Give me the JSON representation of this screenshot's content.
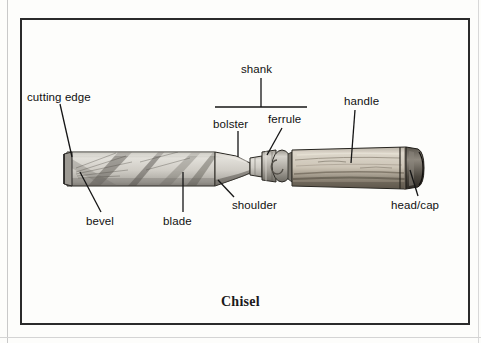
{
  "figure": {
    "caption": "Chisel",
    "frame_color": "#2b2b2b",
    "background_color": "#fdfdfb"
  },
  "labels": [
    {
      "id": "cutting-edge",
      "text": "cutting edge",
      "x": 27,
      "y": 92
    },
    {
      "id": "shank",
      "text": "shank",
      "x": 241,
      "y": 64
    },
    {
      "id": "handle",
      "text": "handle",
      "x": 344,
      "y": 96
    },
    {
      "id": "bolster",
      "text": "bolster",
      "x": 213,
      "y": 119
    },
    {
      "id": "ferrule",
      "text": "ferrule",
      "x": 268,
      "y": 114
    },
    {
      "id": "bevel",
      "text": "bevel",
      "x": 86,
      "y": 216
    },
    {
      "id": "blade",
      "text": "blade",
      "x": 163,
      "y": 216
    },
    {
      "id": "shoulder",
      "text": "shoulder",
      "x": 232,
      "y": 200
    },
    {
      "id": "head-cap",
      "text": "head/cap",
      "x": 391,
      "y": 200
    }
  ],
  "leaders": [
    {
      "id": "leader-cutting-edge",
      "points": "60,104 72,157"
    },
    {
      "id": "leader-shank-stem",
      "points": "261,78 261,107"
    },
    {
      "id": "leader-shank-bar",
      "points": "215,107 307,107"
    },
    {
      "id": "leader-bolster",
      "points": "238,131 238,157"
    },
    {
      "id": "leader-ferrule",
      "points": "282,128 267,155"
    },
    {
      "id": "leader-handle",
      "points": "355,110 351,163"
    },
    {
      "id": "leader-bevel",
      "points": "101,212 80,172"
    },
    {
      "id": "leader-blade",
      "points": "183,212 183,172"
    },
    {
      "id": "leader-shoulder",
      "points": "234,197 218,180"
    },
    {
      "id": "leader-head-cap",
      "points": "418,196 410,170"
    }
  ],
  "artwork": {
    "name": "chisel-illustration",
    "parts": [
      {
        "id": "blade",
        "description": "flat rectangular steel blade with diagonal grind streaks"
      },
      {
        "id": "bevel",
        "description": "ground bevel at the cutting tip"
      },
      {
        "id": "shoulder",
        "description": "tapered transition from blade to shank"
      },
      {
        "id": "bolster",
        "description": "narrow neck section of the shank"
      },
      {
        "id": "ferrule",
        "description": "metal collar ring between shank and handle"
      },
      {
        "id": "handle",
        "description": "turned wooden handle"
      },
      {
        "id": "head-cap",
        "description": "dark metal cap at the handle butt"
      }
    ],
    "colors": {
      "steel_light": "#d9d7d1",
      "steel_mid": "#b6b3ac",
      "steel_dark": "#4a4845",
      "wood_light": "#cfc8bc",
      "wood_mid": "#a89d8d",
      "wood_dark": "#534b40",
      "outline": "#1f1f1f"
    }
  }
}
